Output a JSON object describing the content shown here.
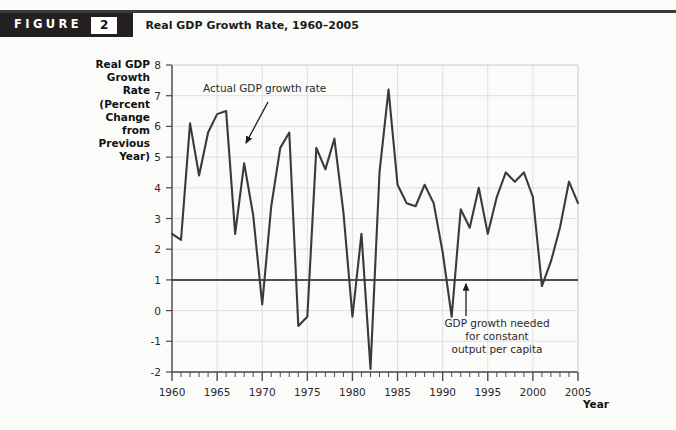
{
  "figure": {
    "label_word": "FIGURE",
    "number": "2",
    "title": "Real GDP Growth Rate, 1960–2005"
  },
  "axis": {
    "y_title_lines": [
      "Real GDP",
      "Growth",
      "Rate",
      "(Percent",
      "Change",
      "from",
      "Previous",
      "Year)"
    ],
    "x_title": "Year",
    "y_ticks": [
      "8",
      "7",
      "6",
      "5",
      "4",
      "3",
      "2",
      "1",
      "0",
      "-1",
      "-2"
    ],
    "x_ticks": [
      "1960",
      "1965",
      "1970",
      "1975",
      "1980",
      "1985",
      "1990",
      "1995",
      "2000",
      "2005"
    ]
  },
  "annotations": {
    "series_label": "Actual GDP growth rate",
    "threshold_lines": [
      "GDP growth needed",
      "for constant",
      "output per capita"
    ]
  },
  "colors": {
    "line": "#3a3a3a",
    "threshold": "#1c1c1c",
    "grid": "#d8d8d8",
    "axis": "#4a4a4a",
    "banner": "#241f20",
    "page_bg": "#fbfbfa"
  },
  "chart_data": {
    "type": "line",
    "title": "Real GDP Growth Rate, 1960–2005",
    "xlabel": "Year",
    "ylabel": "Real GDP Growth Rate (Percent Change from Previous Year)",
    "xlim": [
      1960,
      2005
    ],
    "ylim": [
      -2,
      8
    ],
    "xtick_step": 5,
    "ytick_step": 1,
    "grid": true,
    "legend": "none",
    "threshold_value": 1,
    "threshold_label": "GDP growth needed for constant output per capita",
    "series": [
      {
        "name": "Actual GDP growth rate",
        "x": [
          1960,
          1961,
          1962,
          1963,
          1964,
          1965,
          1966,
          1967,
          1968,
          1969,
          1970,
          1971,
          1972,
          1973,
          1974,
          1975,
          1976,
          1977,
          1978,
          1979,
          1980,
          1981,
          1982,
          1983,
          1984,
          1985,
          1986,
          1987,
          1988,
          1989,
          1990,
          1991,
          1992,
          1993,
          1994,
          1995,
          1996,
          1997,
          1998,
          1999,
          2000,
          2001,
          2002,
          2003,
          2004,
          2005
        ],
        "values": [
          2.5,
          2.3,
          6.1,
          4.4,
          5.8,
          6.4,
          6.5,
          2.5,
          4.8,
          3.1,
          0.2,
          3.4,
          5.3,
          5.8,
          -0.5,
          -0.2,
          5.3,
          4.6,
          5.6,
          3.2,
          -0.2,
          2.5,
          -1.9,
          4.5,
          7.2,
          4.1,
          3.5,
          3.4,
          4.1,
          3.5,
          1.9,
          -0.2,
          3.3,
          2.7,
          4.0,
          2.5,
          3.7,
          4.5,
          4.2,
          4.5,
          3.7,
          0.8,
          1.6,
          2.7,
          4.2,
          3.5
        ]
      }
    ]
  }
}
